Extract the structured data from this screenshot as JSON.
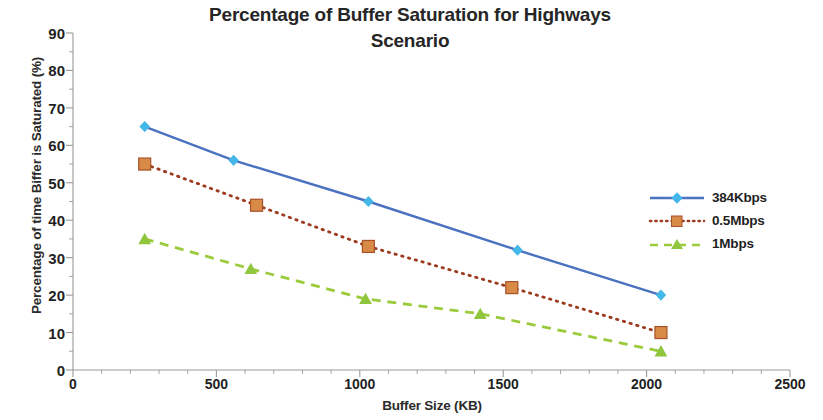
{
  "chart_data": {
    "type": "line",
    "title": "Percentage of Buffer Saturation for Highways Scenario",
    "title_line1": "Percentage of Buffer Saturation for Highways",
    "title_line2": "Scenario",
    "xlabel": "Buffer Size (KB)",
    "ylabel": "Percentage of time Biffer is Saturated (%)",
    "xlim": [
      0,
      2500
    ],
    "ylim": [
      0,
      90
    ],
    "xticks": [
      0,
      500,
      1000,
      1500,
      2000,
      2500
    ],
    "xtick_labels": [
      "0",
      "500",
      "1000",
      "1500",
      "2000",
      "2500"
    ],
    "yticks": [
      0,
      10,
      20,
      30,
      40,
      50,
      60,
      70,
      80,
      90
    ],
    "ytick_labels": [
      "0",
      "10",
      "20",
      "30",
      "40",
      "50",
      "60",
      "70",
      "80",
      "90"
    ],
    "minor_tick_interval": 5,
    "grid": false,
    "legend_position": "right",
    "series": [
      {
        "name": "384Kbps",
        "color": "#4A72C0",
        "marker_color": "#43B7E8",
        "marker": "diamond",
        "line_style": "solid",
        "x": [
          250,
          560,
          1030,
          1550,
          2050
        ],
        "values": [
          65,
          56,
          45,
          32,
          20
        ]
      },
      {
        "name": "0.5Mbps",
        "color": "#BE4B2B",
        "marker_color": "#D78B46",
        "marker": "square",
        "line_style": "dotted",
        "x": [
          250,
          640,
          1030,
          1530,
          2050
        ],
        "values": [
          55,
          44,
          33,
          22,
          10
        ]
      },
      {
        "name": "1Mbps",
        "color": "#9BCB3C",
        "marker_color": "#8FC63D",
        "marker": "triangle",
        "line_style": "dashed",
        "x": [
          250,
          620,
          1020,
          1420,
          2050
        ],
        "values": [
          35,
          27,
          19,
          15,
          5
        ]
      }
    ]
  },
  "legend": {
    "items": [
      {
        "label": "384Kbps"
      },
      {
        "label": "0.5Mbps"
      },
      {
        "label": "1Mbps"
      }
    ]
  },
  "axis_colors": {
    "axis_line": "#9a9a9a",
    "text": "#1f1f1f"
  }
}
